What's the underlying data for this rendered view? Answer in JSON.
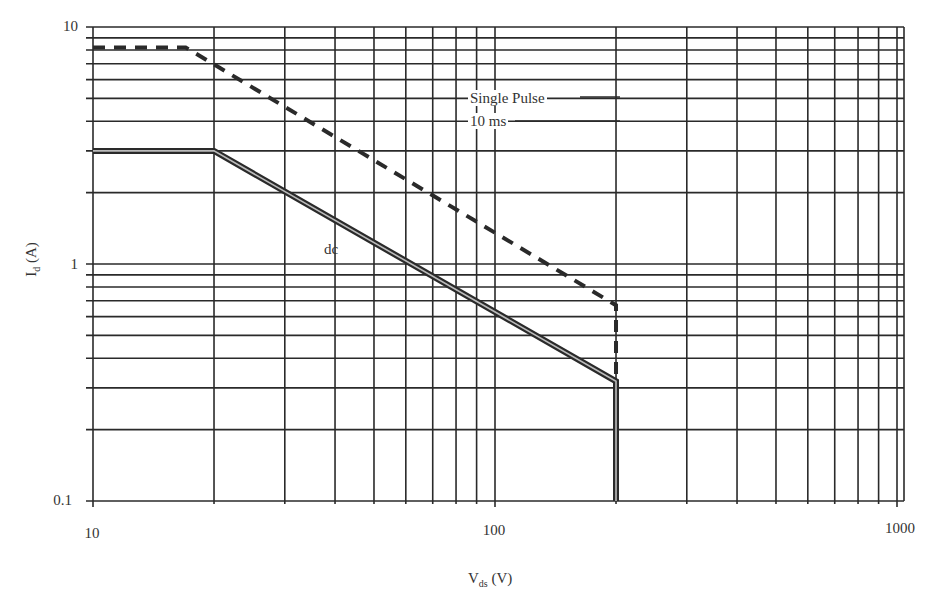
{
  "chart_data": {
    "type": "line",
    "title": "",
    "xlabel": "V_ds (V)",
    "ylabel": "I_d (A)",
    "xscale": "log",
    "yscale": "log",
    "xlim": [
      10,
      1000
    ],
    "ylim": [
      0.1,
      10
    ],
    "grid": true,
    "x_tick_labels": [
      "10",
      "100",
      "1000"
    ],
    "y_tick_labels": [
      "0.1",
      "1",
      "10"
    ],
    "series": [
      {
        "name": "Single Pulse 10 ms",
        "style": "dashed",
        "x": [
          10,
          17,
          200,
          200
        ],
        "y": [
          8.2,
          8.2,
          0.67,
          0.1
        ]
      },
      {
        "name": "dc",
        "style": "solid-thick",
        "x": [
          10,
          20,
          200,
          200
        ],
        "y": [
          3.0,
          3.0,
          0.32,
          0.1
        ]
      }
    ],
    "annotations": [
      {
        "text": "Single Pulse",
        "near_x": 150,
        "near_y": 5.0
      },
      {
        "text": "10 ms",
        "near_x": 150,
        "near_y": 4.0
      },
      {
        "text": "dc",
        "near_x": 45,
        "near_y": 1.3
      }
    ],
    "legend": "none"
  },
  "labels": {
    "ylabel_main": "I",
    "ylabel_sub": "d",
    "ylabel_unit": " (A)",
    "xlabel_main": "V",
    "xlabel_sub": "ds",
    "xlabel_unit": " (V)",
    "ytick_10": "10",
    "ytick_1": "1",
    "ytick_01": "0.1",
    "xtick_10": "10",
    "xtick_100": "100",
    "xtick_1000": "1000",
    "single_pulse": "Single Pulse",
    "ten_ms": "10 ms",
    "dc": "dc"
  },
  "colors": {
    "ink": "#2a2a2a",
    "background": "#ffffff"
  }
}
